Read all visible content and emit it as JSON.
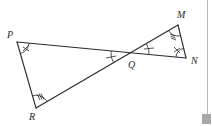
{
  "figure": {
    "type": "geometry-diagram",
    "stroke_color": "#2a2a2a",
    "background_color": "#ffffff"
  },
  "points": {
    "P": {
      "label": "P",
      "x": 17,
      "y": 42
    },
    "R": {
      "label": "R",
      "x": 36,
      "y": 108
    },
    "M": {
      "label": "M",
      "x": 178,
      "y": 25
    },
    "N": {
      "label": "N",
      "x": 186,
      "y": 58
    },
    "Q": {
      "label": "Q",
      "x": 131,
      "y": 53
    }
  },
  "segments": [
    {
      "from": "P",
      "to": "N"
    },
    {
      "from": "R",
      "to": "M"
    },
    {
      "from": "P",
      "to": "R"
    },
    {
      "from": "M",
      "to": "N"
    }
  ],
  "angle_marks": [
    {
      "vertex": "P",
      "marks": "cross",
      "description": "angle at P marked with double-tick cross"
    },
    {
      "vertex": "N",
      "marks": "cross",
      "description": "angle at N marked with double-tick cross"
    },
    {
      "vertex": "R",
      "marks": "triple",
      "description": "angle at R marked with triple ticks"
    },
    {
      "vertex": "M",
      "marks": "triple",
      "description": "angle at M marked with triple ticks"
    },
    {
      "vertex": "Q",
      "side": "left",
      "marks": "single",
      "description": "angle PQR marked with single tick"
    },
    {
      "vertex": "Q",
      "side": "right",
      "marks": "single",
      "description": "angle MQN marked with single tick"
    }
  ],
  "decorations": {
    "right_rule_color": "#b8b8b8",
    "corner_square_color": "#a8a8a8"
  }
}
